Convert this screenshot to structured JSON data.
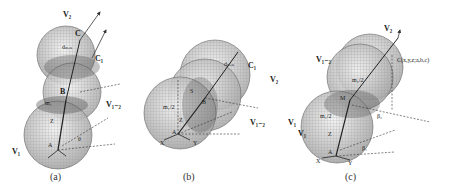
{
  "figure": {
    "panels": [
      {
        "id": "a",
        "caption": "(a)",
        "labels": {
          "v2": "V₂",
          "c": "C",
          "c1": "C₁",
          "dmin": "dₘᵢₙ",
          "b": "B",
          "m1": "m₁",
          "v1_2": "V₁₋₂",
          "z": "Z",
          "a": "A",
          "theta": "θ",
          "v1": "V₁",
          "d": "d"
        }
      },
      {
        "id": "b",
        "caption": "(b)",
        "labels": {
          "c1": "C₁",
          "dmin": "dₘᵢₙ",
          "v2": "V₂",
          "s": "S",
          "m_half": "m₁/2",
          "b": "B",
          "z": "Z",
          "a": "A",
          "x": "X",
          "y": "Y",
          "v1_2": "V₁₋₂",
          "v1": "V₁",
          "m2_half": "m₂/2"
        }
      },
      {
        "id": "c",
        "caption": "(c)",
        "labels": {
          "v2": "V₂",
          "v1_2": "V₁₋₂",
          "c": "C(x,y,z;a,b,c)",
          "m2_half": "m₂/2",
          "m": "M",
          "m1_half": "m₁/2",
          "z": "Z",
          "beta2": "β₂",
          "beta1": "β₁",
          "a": "A",
          "x": "X",
          "y": "Y",
          "v1": "V₁"
        }
      }
    ]
  }
}
